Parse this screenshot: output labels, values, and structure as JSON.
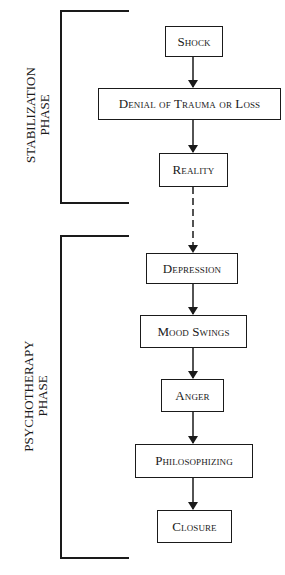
{
  "phases": [
    {
      "id": "stabilization",
      "label_line1": "STABILIZATION",
      "label_line2": "PHASE"
    },
    {
      "id": "psychotherapy",
      "label_line1": "PSYCHOTHERAPY",
      "label_line2": "PHASE"
    }
  ],
  "stages": [
    {
      "id": "shock",
      "label": "Shock",
      "phase": "stabilization"
    },
    {
      "id": "denial",
      "label": "Denial of Trauma or Loss",
      "phase": "stabilization"
    },
    {
      "id": "reality",
      "label": "Reality",
      "phase": "stabilization"
    },
    {
      "id": "depression",
      "label": "Depression",
      "phase": "psychotherapy"
    },
    {
      "id": "mood-swings",
      "label": "Mood Swings",
      "phase": "psychotherapy"
    },
    {
      "id": "anger",
      "label": "Anger",
      "phase": "psychotherapy"
    },
    {
      "id": "philosophizing",
      "label": "Philosophizing",
      "phase": "psychotherapy"
    },
    {
      "id": "closure",
      "label": "Closure",
      "phase": "psychotherapy"
    }
  ],
  "connectors": [
    {
      "from": "shock",
      "to": "denial",
      "style": "solid"
    },
    {
      "from": "denial",
      "to": "reality",
      "style": "solid"
    },
    {
      "from": "reality",
      "to": "depression",
      "style": "dashed"
    },
    {
      "from": "depression",
      "to": "mood-swings",
      "style": "solid"
    },
    {
      "from": "mood-swings",
      "to": "anger",
      "style": "solid"
    },
    {
      "from": "anger",
      "to": "philosophizing",
      "style": "solid"
    },
    {
      "from": "philosophizing",
      "to": "closure",
      "style": "solid"
    }
  ],
  "colors": {
    "ink": "#1a1a1a",
    "background": "#ffffff"
  }
}
